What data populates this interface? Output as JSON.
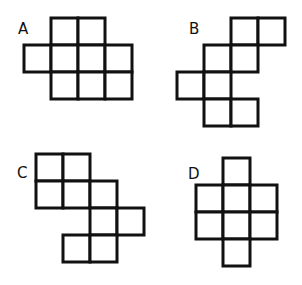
{
  "style": {
    "stroke_color": "#111111",
    "fill_color": "#ffffff",
    "background": "#ffffff",
    "stroke_width": 3,
    "cell_size": 27
  },
  "figures": [
    {
      "label": "A",
      "label_pos": [
        18,
        22
      ],
      "origin": [
        24,
        18
      ],
      "cells": [
        [
          0,
          1
        ],
        [
          0,
          2
        ],
        [
          1,
          0
        ],
        [
          1,
          1
        ],
        [
          1,
          2
        ],
        [
          1,
          3
        ],
        [
          2,
          1
        ],
        [
          2,
          2
        ],
        [
          2,
          3
        ]
      ]
    },
    {
      "label": "B",
      "label_pos": [
        189,
        22
      ],
      "origin": [
        177,
        18
      ],
      "cells": [
        [
          0,
          2
        ],
        [
          0,
          3
        ],
        [
          1,
          1
        ],
        [
          1,
          2
        ],
        [
          2,
          0
        ],
        [
          2,
          1
        ],
        [
          3,
          1
        ],
        [
          3,
          2
        ]
      ]
    },
    {
      "label": "C",
      "label_pos": [
        17,
        166
      ],
      "origin": [
        36,
        154
      ],
      "cells": [
        [
          0,
          0
        ],
        [
          0,
          1
        ],
        [
          1,
          0
        ],
        [
          1,
          1
        ],
        [
          1,
          2
        ],
        [
          2,
          2
        ],
        [
          2,
          3
        ],
        [
          3,
          1
        ],
        [
          3,
          2
        ]
      ]
    },
    {
      "label": "D",
      "label_pos": [
        188,
        167
      ],
      "origin": [
        196,
        158
      ],
      "cells": [
        [
          0,
          1
        ],
        [
          1,
          0
        ],
        [
          1,
          1
        ],
        [
          1,
          2
        ],
        [
          2,
          0
        ],
        [
          2,
          1
        ],
        [
          2,
          2
        ],
        [
          3,
          1
        ]
      ]
    }
  ]
}
